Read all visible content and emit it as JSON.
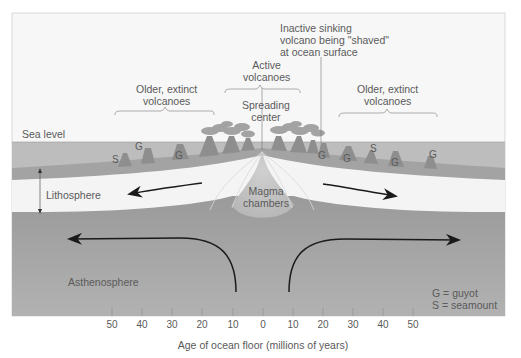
{
  "diagram": {
    "labels": {
      "sea_level": "Sea level",
      "lithosphere": "Lithosphere",
      "asthenosphere": "Asthenosphere",
      "magma_chambers_line1": "Magma",
      "magma_chambers_line2": "chambers",
      "spreading_center_line1": "Spreading",
      "spreading_center_line2": "center",
      "active_volcanoes_line1": "Active",
      "active_volcanoes_line2": "volcanoes",
      "older_left_line1": "Older, extinct",
      "older_left_line2": "volcanoes",
      "older_right_line1": "Older, extinct",
      "older_right_line2": "volcanoes",
      "inactive_line1": "Inactive sinking",
      "inactive_line2": "volcano being \"shaved\"",
      "inactive_line3": "at ocean surface"
    },
    "legend": {
      "guyot": "G = guyot",
      "seamount": "S = seamount"
    },
    "seafloor_markers": {
      "left": [
        "S",
        "G",
        "G"
      ],
      "right": [
        "G",
        "G",
        "S",
        "G",
        "G"
      ]
    },
    "axis": {
      "label": "Age of ocean floor (millions of years)",
      "ticks": [
        "50",
        "40",
        "30",
        "20",
        "10",
        "0",
        "10",
        "20",
        "30",
        "40",
        "50"
      ]
    },
    "colors": {
      "sky": "#f7f7f7",
      "ocean": "#bdbdbd",
      "crust": "#a3a3a3",
      "lithosphere": "#f4f4f4",
      "asthenosphere": "#9c9c9c",
      "magma": "#c8c8c8",
      "volcano": "#8e8e8e",
      "smoke": "#9a9a9a",
      "text": "#5a5a5a",
      "arrow": "#1a1a1a"
    }
  }
}
